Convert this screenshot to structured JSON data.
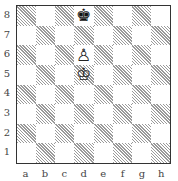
{
  "diagram": {
    "files": [
      "a",
      "b",
      "c",
      "d",
      "e",
      "f",
      "g",
      "h"
    ],
    "ranks": [
      "8",
      "7",
      "6",
      "5",
      "4",
      "3",
      "2",
      "1"
    ],
    "pieces": [
      {
        "square": "d8",
        "color": "black",
        "type": "king",
        "glyph": "♚"
      },
      {
        "square": "d6",
        "color": "white",
        "type": "pawn",
        "glyph": "♙"
      },
      {
        "square": "d5",
        "color": "white",
        "type": "king",
        "glyph": "♔"
      }
    ],
    "colors": {
      "light": "#ffffff",
      "dark_hatch": "#9a9a9a",
      "border": "#333333",
      "label": "#444444"
    }
  }
}
